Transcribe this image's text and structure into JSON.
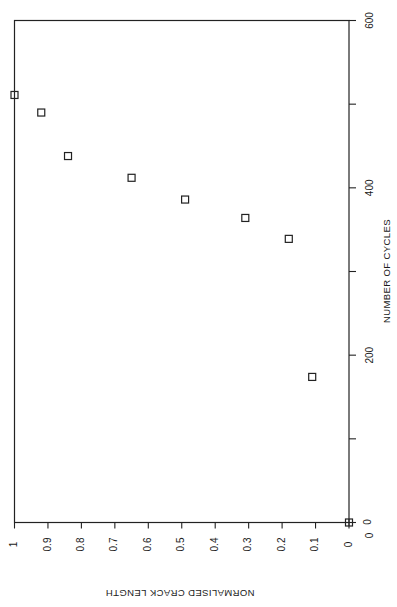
{
  "chart_data": {
    "type": "scatter",
    "title": "",
    "orientation": "rotated-90",
    "xlabel": "NORMALISED CRACK LENGTH",
    "ylabel": "NUMBER OF CYCLES",
    "xlim": [
      0,
      1
    ],
    "ylim": [
      0,
      600
    ],
    "x_ticks": [
      "0",
      "0.1",
      "0.2",
      "0.3",
      "0.4",
      "0.5",
      "0.6",
      "0.7",
      "0.8",
      "0.9",
      "1"
    ],
    "y_ticks": [
      "0",
      "200",
      "400",
      "600"
    ],
    "y_minor_ticks": [
      100,
      300,
      500
    ],
    "grid": false,
    "legend": null,
    "marker": "open-square",
    "series": [
      {
        "name": "data",
        "points": [
          {
            "x": 0.0,
            "y": 0
          },
          {
            "x": 0.11,
            "y": 174
          },
          {
            "x": 0.18,
            "y": 339
          },
          {
            "x": 0.31,
            "y": 364
          },
          {
            "x": 0.49,
            "y": 386
          },
          {
            "x": 0.65,
            "y": 412
          },
          {
            "x": 0.84,
            "y": 438
          },
          {
            "x": 0.92,
            "y": 490
          },
          {
            "x": 1.0,
            "y": 511
          }
        ]
      }
    ]
  },
  "labels": {
    "x_axis_title": "NORMALISED CRACK LENGTH",
    "y_axis_title": "NUMBER OF CYCLES",
    "origin_marker_label": "0"
  }
}
